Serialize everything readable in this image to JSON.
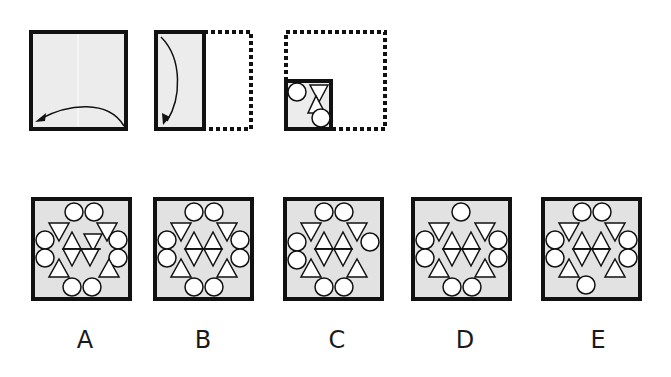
{
  "puzzle": {
    "type": "paper-folding",
    "fill_color": "#ececec",
    "answer_fill_color": "#e2e2e2",
    "stroke_color": "#111111",
    "steps": [
      {
        "id": "step-1",
        "description": "Full square, fold right half over to left",
        "arrow": "curved-left"
      },
      {
        "id": "step-2",
        "description": "Folded rectangle, fold top down to bottom",
        "arrow": "curved-down"
      },
      {
        "id": "step-3",
        "description": "Folded quarter with holes punched",
        "holes": [
          "circle",
          "down-triangle",
          "up-triangle",
          "circle"
        ]
      }
    ]
  },
  "options": [
    {
      "label": "A"
    },
    {
      "label": "B"
    },
    {
      "label": "C"
    },
    {
      "label": "D"
    },
    {
      "label": "E"
    }
  ]
}
